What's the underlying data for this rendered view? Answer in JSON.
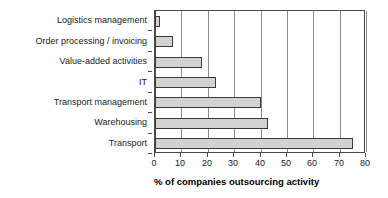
{
  "chart_data": {
    "type": "bar",
    "orientation": "horizontal",
    "title": "",
    "xlabel": "% of companies outsourcing activity",
    "ylabel": "",
    "categories": [
      "Logistics management",
      "Order processing / invoicing",
      "Value-added activities",
      "IT",
      "Transport management",
      "Warehousing",
      "Transport"
    ],
    "values": [
      2,
      7,
      18,
      23,
      40,
      43,
      75
    ],
    "xlim": [
      0,
      80
    ],
    "xticks": [
      0,
      10,
      20,
      30,
      40,
      50,
      60,
      70,
      80
    ],
    "xtick_labels": [
      "0",
      "10",
      "20",
      "30",
      "40",
      "50",
      "60",
      "70",
      "80"
    ],
    "grid": "vertical",
    "legend": "none",
    "bar_fill_color": "#d2d2d2",
    "bar_border_color": "#3a3a3a",
    "axis_color": "#4a4a4a",
    "gridline_color": "#8c8c8c",
    "background_color": "#ffffff"
  }
}
